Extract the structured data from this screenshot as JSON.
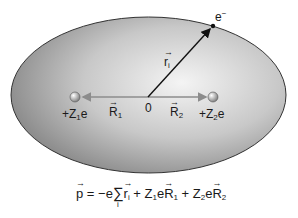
{
  "diagram": {
    "electron": {
      "label": "e",
      "charge_sign": "−"
    },
    "electron_vector": {
      "symbol": "r",
      "subscript": "i"
    },
    "origin_label": "0",
    "nucleus1": {
      "label_prefix": "+Z",
      "subscript": "1",
      "label_suffix": "e"
    },
    "nucleus2": {
      "label_prefix": "+Z",
      "subscript": "2",
      "label_suffix": "e"
    },
    "vector_R1": {
      "symbol": "R",
      "subscript": "1"
    },
    "vector_R2": {
      "symbol": "R",
      "subscript": "2"
    },
    "equation": {
      "lhs": "p",
      "eq_sign": " = −e",
      "sum_symbol": "∑",
      "sum_index": "i",
      "term1": "r",
      "term1_sub": "i",
      "plus1": " + Z",
      "z1_sub": "1",
      "e1": "e",
      "R1": "R",
      "R1_sub": "1",
      "plus2": " + Z",
      "z2_sub": "2",
      "e2": "e",
      "R2": "R",
      "R2_sub": "2"
    },
    "colors": {
      "ellipse_light": "#f2f2f2",
      "ellipse_dark": "#8a8a8a",
      "ellipse_outline": "#333333",
      "axis_line": "#8c8c8c",
      "nucleus": "#a0a0a0",
      "electron_arrow": "#111111"
    }
  }
}
